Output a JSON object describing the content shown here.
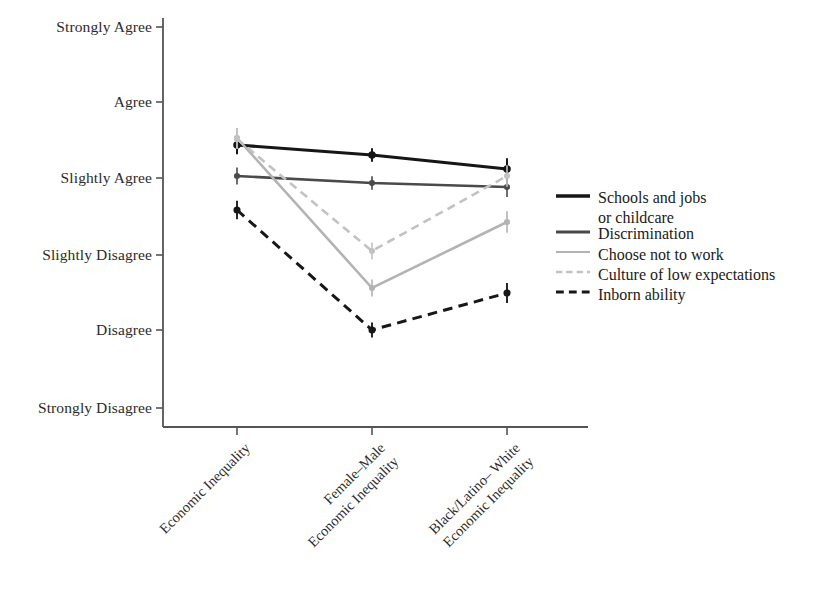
{
  "chart_data": {
    "type": "line",
    "title": "",
    "subtitle": "",
    "xlabel": "",
    "ylabel": "",
    "grid": false,
    "legend_position": "right",
    "categories": [
      "Economic Inequality",
      "Female–Male\nEconomic Inequality",
      "Black/Latino– White\nEconomic Inequality"
    ],
    "x_positions": [
      237,
      372,
      507
    ],
    "y_axis": {
      "tick_labels": [
        "Strongly Agree",
        "Agree",
        "Slightly Agree",
        "Slightly Disagree",
        "Disagree",
        "Strongly Disagree"
      ],
      "tick_values": [
        6,
        5,
        4,
        3,
        2,
        1
      ],
      "tick_pixels": [
        27,
        102,
        178,
        255,
        330,
        408
      ],
      "ylim": [
        1,
        6
      ]
    },
    "series": [
      {
        "name": "Schools and jobs or childcare",
        "color": "#161616",
        "style": "solid",
        "width": 3.2,
        "values": [
          4.43,
          4.3,
          4.12
        ],
        "pixels": [
          145,
          155,
          169
        ],
        "errors": [
          0.12,
          0.09,
          0.14
        ]
      },
      {
        "name": "Discrimination",
        "color": "#4a4a4a",
        "style": "solid",
        "width": 2.6,
        "values": [
          4.03,
          3.95,
          3.9
        ],
        "pixels": [
          176,
          183,
          187
        ],
        "errors": [
          0.11,
          0.09,
          0.13
        ]
      },
      {
        "name": "Choose not to work",
        "color": "#b3b3b3",
        "style": "solid",
        "width": 2.6,
        "values": [
          4.53,
          2.55,
          3.43
        ],
        "pixels": [
          138,
          288,
          222
        ],
        "errors": [
          0.13,
          0.11,
          0.14
        ]
      },
      {
        "name": "Culture of low expectations",
        "color": "#c2c2c2",
        "style": "dashed",
        "width": 2.6,
        "values": [
          4.51,
          3.05,
          4.03
        ],
        "pixels": [
          139,
          251,
          176
        ],
        "errors": [
          0.13,
          0.11,
          0.14
        ]
      },
      {
        "name": "Inborn ability",
        "color": "#171717",
        "style": "dashed",
        "width": 3.0,
        "values": [
          3.59,
          2.0,
          2.49
        ],
        "pixels": [
          210,
          330,
          293
        ],
        "errors": [
          0.12,
          0.1,
          0.13
        ]
      }
    ]
  },
  "axis": {
    "x_start": 163,
    "x_end": 588,
    "y_top": 18,
    "y_bottom": 427,
    "color": "#555555"
  },
  "legend": {
    "items": [
      {
        "label_line1": "Schools and jobs",
        "label_line2": "or childcare",
        "swatch_y": 196,
        "text_y": 188,
        "color": "#161616",
        "style": "solid",
        "width": 3.4
      },
      {
        "label_line1": "Discrimination",
        "label_line2": "",
        "swatch_y": 232,
        "text_y": 224,
        "color": "#4a4a4a",
        "style": "solid",
        "width": 2.8
      },
      {
        "label_line1": "Choose not to work",
        "label_line2": "",
        "swatch_y": 252,
        "text_y": 245,
        "color": "#b3b3b3",
        "style": "solid",
        "width": 2.2
      },
      {
        "label_line1": "Culture of low expectations",
        "label_line2": "",
        "swatch_y": 272,
        "text_y": 265,
        "color": "#c2c2c2",
        "style": "dashed",
        "width": 2.4
      },
      {
        "label_line1": "Inborn ability",
        "label_line2": "",
        "swatch_y": 292,
        "text_y": 285,
        "color": "#171717",
        "style": "dashed",
        "width": 3.0
      }
    ],
    "swatch_x1": 556,
    "swatch_x2": 590,
    "text_x": 598
  }
}
